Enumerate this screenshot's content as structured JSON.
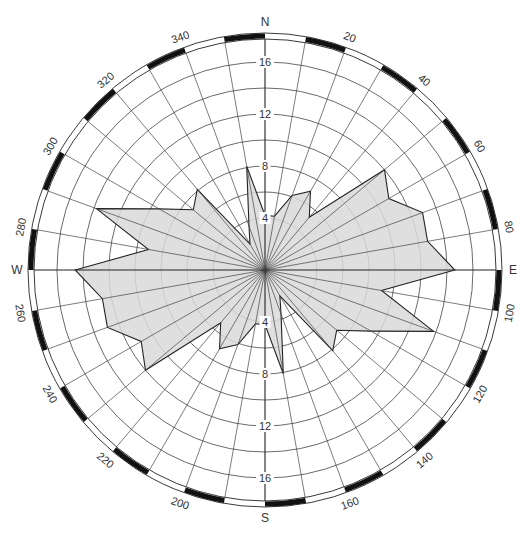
{
  "chart_data": {
    "type": "rose",
    "title": "",
    "angle_unit": "degrees",
    "direction_step": 10,
    "directions": [
      0,
      10,
      20,
      30,
      40,
      50,
      60,
      70,
      80,
      90,
      100,
      110,
      120,
      130,
      140,
      150,
      160,
      170,
      180,
      190,
      200,
      210,
      220,
      230,
      240,
      250,
      260,
      270,
      280,
      290,
      300,
      310,
      320,
      330,
      340,
      350
    ],
    "values": [
      4.2,
      4.2,
      6.1,
      7.0,
      5.3,
      12.0,
      11.0,
      12.9,
      12.7,
      14.6,
      9.1,
      13.8,
      9.4,
      7.2,
      8.1,
      2.3,
      3.6,
      8.1,
      4.2,
      4.2,
      6.1,
      7.0,
      5.3,
      12.0,
      11.0,
      12.9,
      12.7,
      14.6,
      9.1,
      13.8,
      9.4,
      7.2,
      8.1,
      2.3,
      3.6,
      8.1
    ],
    "radial_rings": [
      4,
      6,
      8,
      10,
      12,
      14,
      16
    ],
    "radial_tick_labels": [
      "4",
      "8",
      "12",
      "16"
    ],
    "radial_max": 17.8,
    "angle_tick_labels": [
      "20",
      "40",
      "60",
      "80",
      "100",
      "120",
      "140",
      "160",
      "200",
      "220",
      "240",
      "260",
      "280",
      "300",
      "320",
      "340"
    ],
    "cardinal_labels": {
      "N": "N",
      "E": "E",
      "S": "S",
      "W": "W"
    },
    "grid": true,
    "fill_color": "#d9d9d9",
    "line_color": "#222222"
  },
  "layout": {
    "cx": 265,
    "cy": 270,
    "px_per_unit": 13
  }
}
